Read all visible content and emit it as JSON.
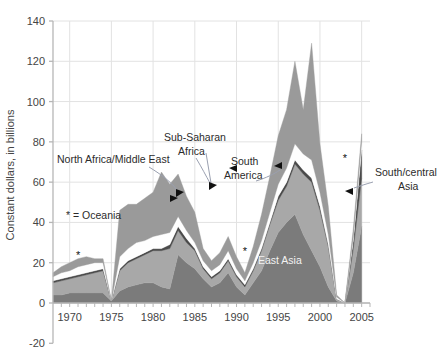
{
  "chart_data": {
    "type": "area",
    "stacked": true,
    "title": "",
    "xlabel": "",
    "ylabel": "Constant dollars, in billions",
    "xlim": [
      1968,
      2006
    ],
    "ylim": [
      -20,
      140
    ],
    "ytick_values": [
      -20,
      0,
      20,
      40,
      60,
      80,
      100,
      120,
      140
    ],
    "ytick_labels": [
      "-20",
      "0",
      "20",
      "40",
      "60",
      "80",
      "100",
      "120",
      "140"
    ],
    "xtick_values": [
      1970,
      1975,
      1980,
      1985,
      1990,
      1995,
      2000,
      2005
    ],
    "xtick_labels": [
      "1970",
      "1975",
      "1980",
      "1985",
      "1990",
      "1995",
      "2000",
      "2005"
    ],
    "minor_xticks_every": 1,
    "grid": true,
    "legend_position": "inline-annotations",
    "x": [
      1968,
      1969,
      1970,
      1971,
      1972,
      1973,
      1974,
      1975,
      1976,
      1977,
      1978,
      1979,
      1980,
      1981,
      1982,
      1983,
      1984,
      1985,
      1986,
      1987,
      1988,
      1989,
      1990,
      1991,
      1992,
      1993,
      1994,
      1995,
      1996,
      1997,
      1998,
      1999,
      2000,
      2001,
      2002,
      2003,
      2004,
      2005
    ],
    "series": [
      {
        "name": "East Asia",
        "color": "#7b7b7b",
        "values": [
          4,
          4,
          5,
          5,
          5,
          5,
          5,
          1,
          6,
          8,
          9,
          10,
          10,
          8,
          7,
          24,
          20,
          17,
          12,
          8,
          10,
          15,
          8,
          4,
          10,
          16,
          26,
          35,
          40,
          44,
          34,
          26,
          18,
          8,
          1,
          0,
          15,
          38
        ]
      },
      {
        "name": "South America",
        "color": "#a8a8a8",
        "values": [
          6,
          7,
          7,
          8,
          9,
          10,
          11,
          0,
          10,
          12,
          13,
          14,
          16,
          18,
          20,
          12,
          10,
          9,
          5,
          4,
          5,
          6,
          5,
          4,
          6,
          10,
          13,
          16,
          18,
          25,
          30,
          34,
          28,
          20,
          1,
          0,
          12,
          24
        ]
      },
      {
        "name": "South/central Asia",
        "color": "#4a4a4a",
        "values": [
          1,
          1,
          1,
          1,
          1,
          1,
          1,
          0,
          1,
          1,
          1,
          1,
          1,
          1,
          2,
          2,
          2,
          1,
          1,
          1,
          1,
          1,
          1,
          1,
          1,
          1,
          1,
          2,
          2,
          2,
          2,
          2,
          2,
          1,
          0,
          0,
          4,
          14
        ]
      },
      {
        "name": "North Africa/Middle East",
        "color": "#fefefe",
        "values": [
          2,
          3,
          3,
          4,
          4,
          4,
          3,
          0,
          6,
          6,
          7,
          6,
          6,
          7,
          6,
          5,
          4,
          3,
          3,
          3,
          3,
          4,
          3,
          2,
          3,
          4,
          5,
          6,
          7,
          8,
          8,
          9,
          7,
          5,
          1,
          0,
          2,
          4
        ]
      },
      {
        "name": "Sub-Saharan Africa",
        "color": "#9a9a9a",
        "values": [
          2,
          3,
          4,
          4,
          4,
          2,
          2,
          0,
          23,
          22,
          19,
          21,
          22,
          31,
          24,
          21,
          17,
          15,
          6,
          5,
          6,
          7,
          6,
          4,
          8,
          13,
          18,
          24,
          29,
          41,
          22,
          58,
          24,
          14,
          1,
          0,
          4,
          4
        ]
      }
    ],
    "annotations": [
      {
        "text": "North Africa/Middle East",
        "target_series": "North Africa/Middle East"
      },
      {
        "text": "Sub-Saharan Africa",
        "target_series": "Sub-Saharan Africa"
      },
      {
        "text": "South America",
        "target_series": "South America"
      },
      {
        "text": "South/central Asia",
        "target_series": "South/central Asia"
      },
      {
        "text": "East Asia",
        "target_series": "East Asia"
      }
    ],
    "footnote": "* = Oceania",
    "oceania_markers": [
      {
        "x": 1971,
        "y": 22
      },
      {
        "x": 1991,
        "y": 24
      },
      {
        "x": 2003,
        "y": 70
      }
    ]
  },
  "labels": {
    "y_axis_title": "Constant dollars, in billions",
    "oceania_note": "* = Oceania",
    "north_africa": "North Africa/Middle East",
    "sub_saharan_l1": "Sub-Saharan",
    "sub_saharan_l2": "Africa",
    "south_america_l1": "South",
    "south_america_l2": "America",
    "south_central_l1": "South/central",
    "south_central_l2": "Asia",
    "east_asia": "East Asia",
    "star": "*"
  },
  "ticks": {
    "y": [
      "140",
      "120",
      "100",
      "80",
      "60",
      "40",
      "20",
      "0",
      "-20"
    ],
    "x": [
      "1970",
      "1975",
      "1980",
      "1985",
      "1990",
      "1995",
      "2000",
      "2005"
    ]
  },
  "colors": {
    "east_asia": "#7b7b7b",
    "south_america": "#a8a8a8",
    "south_central_asia": "#4a4a4a",
    "north_africa": "#fefefe",
    "sub_saharan": "#9a9a9a",
    "grid": "#e2e2e2",
    "axis": "#b6b6b6",
    "text": "#454545"
  }
}
